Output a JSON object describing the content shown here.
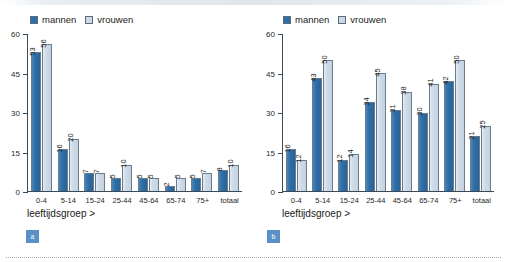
{
  "chart_data": [
    {
      "type": "bar",
      "panel": "a",
      "title": "",
      "xlabel": "leeftijdsgroep >",
      "ylabel": "",
      "ylim": [
        0,
        60
      ],
      "yticks": [
        0,
        15,
        30,
        45,
        60
      ],
      "grid": false,
      "legend_position": "top-left",
      "categories": [
        "0-4",
        "5-14",
        "15-24",
        "25-44",
        "45-64",
        "65-74",
        "75+",
        "totaal"
      ],
      "series": [
        {
          "name": "mannen",
          "color": "#2f6fa8",
          "values": [
            53,
            16,
            7,
            5,
            5,
            2,
            5,
            8
          ]
        },
        {
          "name": "vrouwen",
          "color": "#cdd9e6",
          "values": [
            56,
            20,
            7,
            10,
            5,
            5,
            7,
            10
          ]
        }
      ]
    },
    {
      "type": "bar",
      "panel": "b",
      "title": "",
      "xlabel": "leeftijdsgroep >",
      "ylabel": "",
      "ylim": [
        0,
        60
      ],
      "yticks": [
        0,
        15,
        30,
        45,
        60
      ],
      "grid": false,
      "legend_position": "top-left",
      "categories": [
        "0-4",
        "5-14",
        "15-24",
        "25-44",
        "45-64",
        "65-74",
        "75+",
        "totaal"
      ],
      "series": [
        {
          "name": "mannen",
          "color": "#2f6fa8",
          "values": [
            16,
            43,
            12,
            34,
            31,
            30,
            42,
            21
          ]
        },
        {
          "name": "vrouwen",
          "color": "#cdd9e6",
          "values": [
            12,
            50,
            14,
            45,
            38,
            41,
            50,
            25
          ]
        }
      ]
    }
  ],
  "figures": [
    {
      "badge": "a",
      "legend": [
        {
          "label": "mannen",
          "swatch": "men-swatch-icon"
        },
        {
          "label": "vrouwen",
          "swatch": "women-swatch-icon"
        }
      ],
      "axis_title": "leeftijdsgroep >"
    },
    {
      "badge": "b",
      "legend": [
        {
          "label": "mannen",
          "swatch": "men-swatch-icon"
        },
        {
          "label": "vrouwen",
          "swatch": "women-swatch-icon"
        }
      ],
      "axis_title": "leeftijdsgroep >"
    }
  ]
}
